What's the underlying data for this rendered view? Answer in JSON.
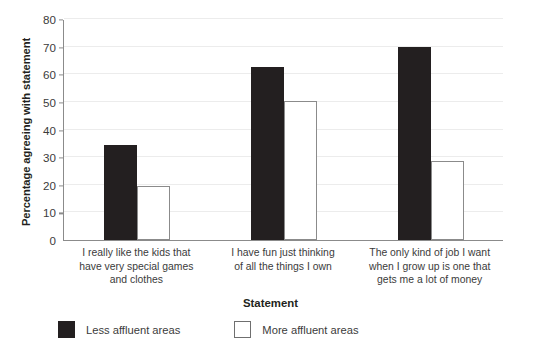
{
  "chart_data": {
    "type": "bar",
    "title": "",
    "xlabel": "Statement",
    "ylabel": "Percentage agreeing with statement",
    "ylim": [
      0,
      80
    ],
    "ytick_step": 10,
    "yticks": [
      0,
      10,
      20,
      30,
      40,
      50,
      60,
      70,
      80
    ],
    "grid": true,
    "legend_position": "bottom-left",
    "categories": [
      "I really like the kids that have very special games and clothes",
      "I have fun just thinking of all the things I own",
      "The only kind of job I want when I grow up is one that gets me a lot of money"
    ],
    "category_lines": [
      [
        "I really like the kids that",
        "have very special games",
        "and clothes"
      ],
      [
        "I have fun just thinking",
        "of all the things I own"
      ],
      [
        "The only kind of job I want",
        "when I grow up is one that",
        "gets me a lot of money"
      ]
    ],
    "series": [
      {
        "name": "Less affluent areas",
        "color": "#231f20",
        "values": [
          34.5,
          62.5,
          70
        ]
      },
      {
        "name": "More affluent areas",
        "color": "#ffffff",
        "edge_color": "#8b8b8b",
        "values": [
          19.5,
          50.5,
          28.5
        ]
      }
    ]
  },
  "legend": {
    "items": [
      {
        "label": "Less affluent areas",
        "style": "less"
      },
      {
        "label": "More affluent areas",
        "style": "more"
      }
    ]
  },
  "colors": {
    "bar_filled": "#231f20",
    "bar_open_edge": "#8b8b8b",
    "axis": "#8b8b8b",
    "gridline": "#ececec",
    "text": "#3b3b3b",
    "background": "#ffffff"
  }
}
